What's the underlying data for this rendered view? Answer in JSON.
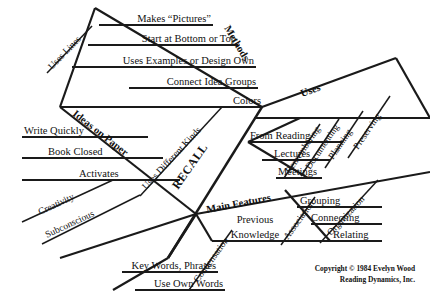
{
  "diagram": {
    "type": "fishbone-ishikawa",
    "title": "RECALL",
    "center_label": "RECALL",
    "spine_sub_label": "Uses Different Kinds",
    "background_color": "#ffffff",
    "line_color": "#1a1a1a",
    "branches": [
      {
        "id": "methods",
        "label": "Methods",
        "position": "upper-left",
        "items": [
          "Makes “Pictures”",
          "Start at Bottom or Top",
          "Uses Examples or Design Own",
          "Connect Idea Groups",
          "Colors"
        ],
        "sub_branches": [
          {
            "label": "Uses Lines",
            "items": []
          }
        ]
      },
      {
        "id": "ideas-on-paper",
        "label": "Ideas on Paper",
        "position": "lower-left-upper",
        "items": [
          "Write Quickly",
          "Book Closed",
          "Activates"
        ],
        "sub_branches": [
          {
            "label": "Creativity",
            "items": []
          },
          {
            "label": "Subconscious",
            "items": []
          }
        ]
      },
      {
        "id": "uses",
        "label": "Uses",
        "position": "upper-right",
        "items": [
          "From Reading",
          "Lectures",
          "Meetings"
        ],
        "sub_branches": [
          {
            "label": "Remembering",
            "items": []
          },
          {
            "label": "Documenting",
            "items": []
          },
          {
            "label": "Planning",
            "items": []
          },
          {
            "label": "Preserving",
            "items": []
          }
        ]
      },
      {
        "id": "main-features",
        "label": "Main Features",
        "position": "lower-right",
        "items": [
          "Grouping",
          "Connecting",
          "Relating",
          "Previous",
          "Knowledge",
          "Key Words, Phrases",
          "Use Own Words"
        ],
        "sub_branches": [
          {
            "label": "Condensation",
            "items": [
              "Key Words, Phrases",
              "Use Own Words"
            ]
          },
          {
            "label": "Association",
            "items": [
              "Previous",
              "Knowledge"
            ]
          },
          {
            "label": "Organization",
            "items": [
              "Grouping",
              "Connecting",
              "Relating"
            ]
          }
        ]
      }
    ]
  },
  "labels": {
    "methods": "Methods",
    "uses": "Uses",
    "ideas_on_paper": "Ideas on Paper",
    "main_features": "Main Features",
    "recall": "RECALL",
    "uses_different_kinds": "Uses Different Kinds",
    "uses_lines": "Uses Lines",
    "makes_pictures": "Makes “Pictures”",
    "start_bottom_top": "Start at Bottom or Top",
    "uses_examples": "Uses Examples or Design Own",
    "connect_idea_groups": "Connect Idea Groups",
    "colors": "Colors",
    "write_quickly": "Write Quickly",
    "book_closed": "Book Closed",
    "activates": "Activates",
    "creativity": "Creativity",
    "subconscious": "Subconscious",
    "from_reading": "From Reading",
    "lectures": "Lectures",
    "meetings": "Meetings",
    "remembering": "Remembering",
    "documenting": "Documenting",
    "planning": "Planning",
    "preserving": "Preserving",
    "grouping": "Grouping",
    "connecting": "Connecting",
    "relating": "Relating",
    "previous": "Previous",
    "knowledge": "Knowledge",
    "association": "Association",
    "organization": "Organization",
    "condensation": "Condensation",
    "key_words_phrases": "Key Words, Phrases",
    "use_own_words": "Use Own Words"
  },
  "copyright": {
    "line1": "Copyright © 1984 Evelyn Wood",
    "line2": "Reading Dynamics, Inc."
  }
}
